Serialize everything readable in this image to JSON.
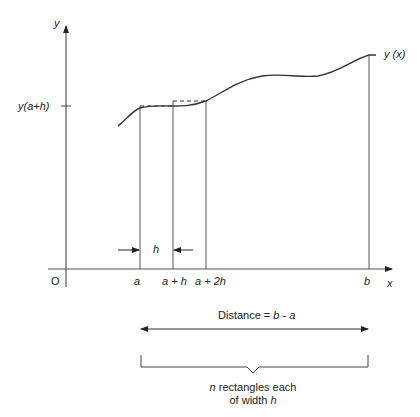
{
  "diagram": {
    "axes": {
      "y_label": "y",
      "x_label": "x",
      "origin_label": "O",
      "y_tick_label": "y(a+h)"
    },
    "curve_label": "y (x)",
    "x_ticks": [
      {
        "label": "a",
        "x": 140
      },
      {
        "label": "a + h",
        "x": 173
      },
      {
        "label": "a + 2h",
        "x": 206
      },
      {
        "label": "b",
        "x": 369
      }
    ],
    "width_marker": {
      "label": "h"
    },
    "distance": {
      "prefix": "Distance = ",
      "expression": "b - a"
    },
    "bracket_caption": {
      "line1_var": "n",
      "line1_rest": " rectangles each",
      "line2_prefix": "of width ",
      "line2_var": "h"
    },
    "colors": {
      "line": "#222222",
      "curve": "#333333",
      "background": "#ffffff"
    }
  }
}
